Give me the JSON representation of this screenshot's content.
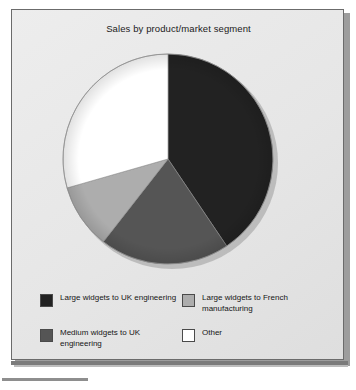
{
  "chart_data": {
    "type": "pie",
    "title": "Sales by product/market segment",
    "xlabel": "",
    "ylabel": "",
    "legend_position": "bottom",
    "grid": false,
    "start_angle_deg": 0,
    "direction": "clockwise",
    "categories": [
      "Large widgets to UK engineering",
      "Medium widgets to UK engineering",
      "Large widgets to French manufacturing",
      "Other"
    ],
    "values": [
      40.5,
      20.0,
      10.0,
      29.5
    ],
    "colors": [
      "#222222",
      "#555555",
      "#adadad",
      "#ffffff"
    ],
    "slices": [
      {
        "label": "Large widgets to UK engineering",
        "value": 40.5,
        "color": "#222222",
        "start_deg": 0,
        "end_deg": 146
      },
      {
        "label": "Medium widgets to UK engineering",
        "value": 20.0,
        "color": "#555555",
        "start_deg": 146,
        "end_deg": 218
      },
      {
        "label": "Large widgets to French manufacturing",
        "value": 10.0,
        "color": "#adadad",
        "start_deg": 218,
        "end_deg": 254
      },
      {
        "label": "Other",
        "value": 29.5,
        "color": "#ffffff",
        "start_deg": 254,
        "end_deg": 360
      }
    ]
  },
  "legend": {
    "items": [
      {
        "label": "Large widgets to UK engineering",
        "color": "#222222",
        "icon": "legend-swatch-black"
      },
      {
        "label": "Large widgets to French manufacturing",
        "color": "#adadad",
        "icon": "legend-swatch-light-gray"
      },
      {
        "label": "Medium widgets to UK engineering",
        "color": "#555555",
        "icon": "legend-swatch-dark-gray"
      },
      {
        "label": "Other",
        "color": "#ffffff",
        "icon": "legend-swatch-white"
      }
    ]
  },
  "style": {
    "panel_background": "#e9e9e9",
    "panel_border": "#6b6b6b",
    "text_color": "#161616"
  }
}
